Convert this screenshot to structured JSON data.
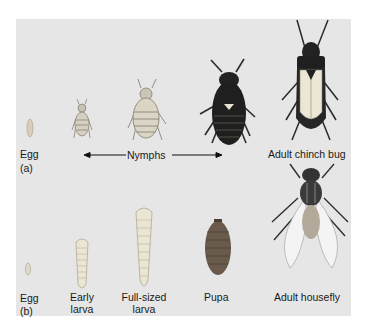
{
  "figure": {
    "background_color": "#e6e6e6",
    "panel_a": {
      "tag": "(a)",
      "stages": [
        {
          "label": "Egg"
        },
        {
          "label": "Nymphs",
          "spans": "3 nymph stages"
        },
        {
          "label": "Adult chinch bug"
        }
      ],
      "arrow": "double-headed arrow spanning nymph stages"
    },
    "panel_b": {
      "tag": "(b)",
      "stages": [
        {
          "label": "Egg"
        },
        {
          "label_line1": "Early",
          "label_line2": "larva"
        },
        {
          "label_line1": "Full-sized",
          "label_line2": "larva"
        },
        {
          "label": "Pupa"
        },
        {
          "label": "Adult housefly"
        }
      ]
    }
  }
}
